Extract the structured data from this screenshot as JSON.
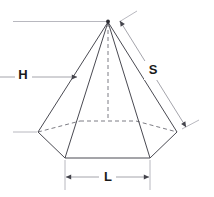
{
  "figure": {
    "shape": "hexagonal pyramid",
    "labels": {
      "height": "H",
      "slant": "S",
      "side_length": "L"
    },
    "colors": {
      "solid_edge": "#4a4a52",
      "hidden_edge": "#6e6e76",
      "dimension_line": "#9a9aa2",
      "label_text": "#1a1a1a",
      "background": "#ffffff"
    },
    "geometry": {
      "apex": [
        108,
        21
      ],
      "base_center": [
        108,
        120
      ],
      "vertices_visible": [
        [
          38,
          132
        ],
        [
          65,
          158
        ],
        [
          150,
          158
        ],
        [
          177,
          132
        ]
      ],
      "vertices_hidden": [
        [
          136,
          121
        ],
        [
          80,
          121
        ]
      ]
    },
    "dimensions": [
      {
        "name": "H",
        "orientation": "vertical",
        "from": [
          23,
          22
        ],
        "to": [
          23,
          132
        ]
      },
      {
        "name": "S",
        "orientation": "diagonal",
        "from": [
          123,
          18
        ],
        "to": [
          187,
          126
        ]
      },
      {
        "name": "L",
        "orientation": "horizontal",
        "from": [
          65,
          177
        ],
        "to": [
          150,
          177
        ]
      }
    ]
  }
}
